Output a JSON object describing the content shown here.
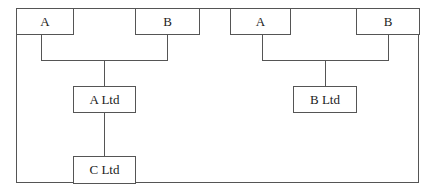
{
  "diagram": {
    "type": "ownership-structure",
    "groups": [
      {
        "shareholders": [
          {
            "label": "A"
          },
          {
            "label": "B"
          }
        ],
        "company": {
          "label": "A Ltd"
        },
        "subsidiary": {
          "label": "C Ltd"
        }
      },
      {
        "shareholders": [
          {
            "label": "A"
          },
          {
            "label": "B"
          }
        ],
        "company": {
          "label": "B Ltd"
        }
      }
    ]
  }
}
